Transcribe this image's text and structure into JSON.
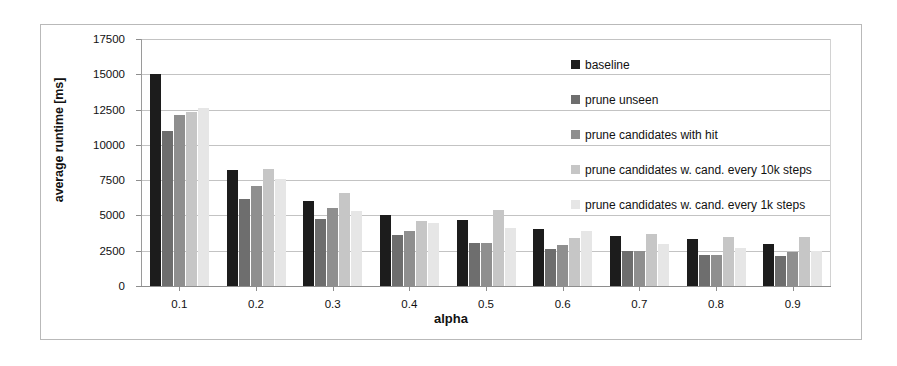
{
  "chart_data": {
    "type": "bar",
    "title": "",
    "xlabel": "alpha",
    "ylabel": "average runtime [ms]",
    "categories": [
      "0.1",
      "0.2",
      "0.3",
      "0.4",
      "0.5",
      "0.6",
      "0.7",
      "0.8",
      "0.9"
    ],
    "ylim": [
      0,
      17500
    ],
    "yticks": [
      0,
      2500,
      5000,
      7500,
      10000,
      12500,
      15000,
      17500
    ],
    "ytick_labels": [
      "0",
      "2500",
      "5000",
      "7500",
      "10000",
      "12500",
      "15000",
      "17500"
    ],
    "grid": true,
    "legend_position": "inside-top-right",
    "series": [
      {
        "name": "baseline",
        "color": "#1c1c1c",
        "values": [
          15000,
          8200,
          6000,
          5000,
          4650,
          4050,
          3550,
          3300,
          3000
        ]
      },
      {
        "name": "prune unseen",
        "color": "#6e6e6e",
        "values": [
          10950,
          6200,
          4750,
          3600,
          3050,
          2600,
          2500,
          2200,
          2100
        ]
      },
      {
        "name": "prune candidates with hit",
        "color": "#8f8f8f",
        "values": [
          12150,
          7100,
          5500,
          3900,
          3050,
          2900,
          2500,
          2200,
          2400
        ]
      },
      {
        "name": "prune candidates w. cand. every 10k steps",
        "color": "#c6c6c6",
        "values": [
          12300,
          8300,
          6600,
          4600,
          5400,
          3400,
          3650,
          3450,
          3450
        ]
      },
      {
        "name": "prune candidates w. cand. every 1k steps",
        "color": "#e6e6e6",
        "values": [
          12600,
          7600,
          5300,
          4500,
          4100,
          3900,
          2950,
          2700,
          2450
        ]
      }
    ]
  }
}
